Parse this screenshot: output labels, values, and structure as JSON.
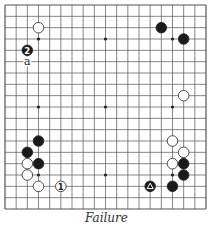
{
  "caption": "Failure",
  "board": {
    "size": 19,
    "left": 5,
    "top": 5,
    "right": 206,
    "bottom": 209,
    "line_color": "#555555",
    "star_points": [
      [
        4,
        4
      ],
      [
        10,
        4
      ],
      [
        16,
        4
      ],
      [
        4,
        10
      ],
      [
        10,
        10
      ],
      [
        16,
        10
      ],
      [
        4,
        16
      ],
      [
        10,
        16
      ],
      [
        16,
        16
      ]
    ]
  },
  "stones": [
    {
      "color": "white",
      "col": 4,
      "row": 3
    },
    {
      "color": "black",
      "col": 3,
      "row": 5,
      "label": "2"
    },
    {
      "color": "black",
      "col": 15,
      "row": 3
    },
    {
      "color": "black",
      "col": 17,
      "row": 4
    },
    {
      "color": "white",
      "col": 17,
      "row": 9
    },
    {
      "color": "black",
      "col": 4,
      "row": 13
    },
    {
      "color": "black",
      "col": 3,
      "row": 14
    },
    {
      "color": "white",
      "col": 3,
      "row": 15
    },
    {
      "color": "black",
      "col": 4,
      "row": 15
    },
    {
      "color": "white",
      "col": 3,
      "row": 16
    },
    {
      "color": "white",
      "col": 4,
      "row": 17
    },
    {
      "color": "white",
      "col": 6,
      "row": 17,
      "label": "1"
    },
    {
      "color": "white",
      "col": 16,
      "row": 13
    },
    {
      "color": "white",
      "col": 17,
      "row": 14
    },
    {
      "color": "white",
      "col": 16,
      "row": 15
    },
    {
      "color": "black",
      "col": 17,
      "row": 15
    },
    {
      "color": "black",
      "col": 17,
      "row": 16
    },
    {
      "color": "black",
      "col": 16,
      "row": 17
    },
    {
      "color": "black",
      "col": 14,
      "row": 17,
      "mark": "triangle"
    }
  ],
  "letters": [
    {
      "col": 3,
      "row": 6,
      "text": "a"
    }
  ]
}
